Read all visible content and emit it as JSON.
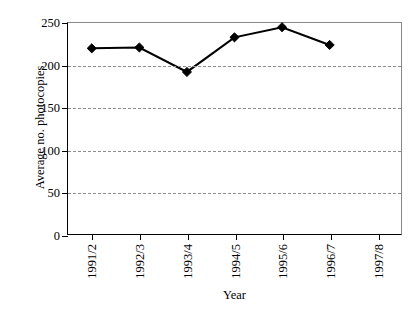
{
  "chart_data": {
    "type": "line",
    "title": "",
    "xlabel": "Year",
    "ylabel": "Average no. photocopies",
    "categories": [
      "1991/2",
      "1992/3",
      "1993/4",
      "1994/5",
      "1995/6",
      "1996/7",
      "1997/8"
    ],
    "values": [
      220,
      221,
      192,
      233,
      245,
      224,
      null
    ],
    "series": [
      {
        "name": "Average no. photocopies",
        "values": [
          220,
          221,
          192,
          233,
          245,
          224,
          null
        ]
      }
    ],
    "ylim": [
      0,
      250
    ],
    "yticks": [
      0,
      50,
      100,
      150,
      200,
      250
    ],
    "ytick_labels": [
      "0",
      "50",
      "100",
      "150",
      "200",
      "250"
    ],
    "grid": "horizontal-dashed",
    "gridlines": [
      50,
      100,
      150,
      200
    ],
    "legend": "none",
    "marker": "diamond",
    "line_color": "#000000",
    "marker_color": "#000000",
    "grid_color": "#8d8d8d",
    "background_color": "#ffffff"
  }
}
